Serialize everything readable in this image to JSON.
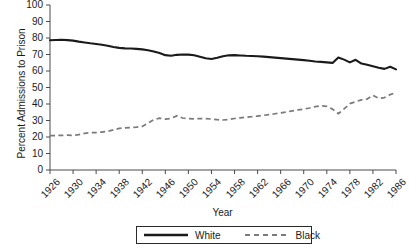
{
  "chart_data": {
    "type": "line",
    "title": "",
    "xlabel": "Year",
    "ylabel": "Percent Admissions to Prison",
    "xlim": [
      1926,
      1986
    ],
    "ylim": [
      0,
      100
    ],
    "grid": false,
    "legend_position": "bottom",
    "yticks": [
      100,
      90,
      80,
      70,
      60,
      50,
      40,
      30,
      20,
      10,
      0
    ],
    "xticks": [
      1926,
      1930,
      1934,
      1938,
      1942,
      1946,
      1950,
      1954,
      1958,
      1962,
      1966,
      1970,
      1974,
      1978,
      1982,
      1986
    ],
    "x": [
      1926,
      1927,
      1928,
      1929,
      1930,
      1931,
      1932,
      1933,
      1934,
      1935,
      1936,
      1937,
      1938,
      1939,
      1940,
      1941,
      1942,
      1943,
      1944,
      1945,
      1946,
      1947,
      1948,
      1949,
      1950,
      1951,
      1952,
      1953,
      1954,
      1955,
      1956,
      1957,
      1958,
      1959,
      1960,
      1961,
      1962,
      1963,
      1964,
      1965,
      1966,
      1967,
      1968,
      1969,
      1970,
      1971,
      1972,
      1973,
      1974,
      1975,
      1976,
      1977,
      1978,
      1979,
      1980,
      1981,
      1982,
      1983,
      1984,
      1985,
      1986
    ],
    "series": [
      {
        "name": "White",
        "style": "solid",
        "color": "#1a1a1a",
        "values": [
          78.6,
          78.8,
          78.9,
          78.7,
          78.4,
          77.8,
          77.3,
          76.8,
          76.4,
          75.9,
          75.3,
          74.6,
          74.0,
          73.7,
          73.6,
          73.4,
          73.1,
          72.6,
          71.8,
          70.9,
          69.6,
          69.2,
          69.8,
          70.0,
          69.9,
          69.5,
          68.6,
          67.7,
          67.3,
          68.0,
          68.9,
          69.5,
          69.6,
          69.4,
          69.2,
          69.1,
          68.9,
          68.7,
          68.4,
          68.1,
          67.8,
          67.5,
          67.2,
          66.9,
          66.6,
          66.2,
          65.8,
          65.5,
          65.2,
          64.9,
          68.2,
          66.9,
          65.2,
          66.8,
          64.5,
          63.8,
          62.9,
          62.0,
          61.3,
          62.6,
          61.0
        ]
      },
      {
        "name": "Black",
        "style": "dashed",
        "color": "#7a7a7a",
        "values": [
          20.8,
          20.9,
          21.0,
          21.1,
          21.0,
          21.4,
          22.2,
          22.6,
          22.7,
          23.0,
          23.4,
          24.3,
          25.2,
          25.5,
          25.7,
          26.0,
          26.4,
          28.4,
          30.5,
          31.4,
          30.8,
          31.3,
          32.8,
          31.5,
          31.1,
          31.0,
          31.2,
          31.1,
          30.9,
          30.5,
          30.3,
          30.6,
          31.2,
          31.6,
          32.0,
          32.3,
          32.7,
          33.1,
          33.6,
          34.1,
          34.6,
          35.2,
          35.8,
          36.4,
          36.9,
          37.6,
          38.4,
          38.9,
          38.6,
          36.9,
          34.1,
          37.1,
          40.2,
          41.4,
          42.5,
          43.0,
          45.2,
          43.4,
          43.9,
          45.7,
          46.9
        ]
      }
    ]
  },
  "legend": {
    "items": [
      {
        "label": "White",
        "style": "solid"
      },
      {
        "label": "Black",
        "style": "dashed"
      }
    ]
  }
}
